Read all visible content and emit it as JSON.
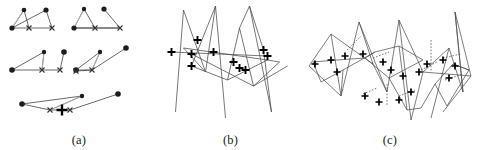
{
  "figure": {
    "background_color": "#ffffff",
    "line_color": "#3a3a3a",
    "marker_color": "#111111",
    "dot_color": "#222222",
    "faint_line_color": "#9a9a9a",
    "width": 477,
    "height": 150
  },
  "panels": [
    {
      "id": "a",
      "caption": "(a)",
      "description": "Six small point-set matching sketches: filled round dots joined to cross markers by thin straight segments",
      "marker_types": [
        "filled-dot",
        "x-cross",
        "bold-plus"
      ],
      "subfigures": [
        {
          "name": "subfigure-top-left",
          "dots": [
            [
              12,
              28
            ],
            [
              24,
              10
            ],
            [
              46,
              10
            ]
          ],
          "crosses": [
            [
              29,
              28
            ],
            [
              52,
              28
            ]
          ],
          "edges": [
            [
              0,
              1
            ],
            [
              0,
              3
            ],
            [
              1,
              3
            ],
            [
              2,
              4
            ],
            [
              3,
              4
            ],
            [
              0,
              2
            ]
          ]
        },
        {
          "name": "subfigure-top-right",
          "dots": [
            [
              74,
              28
            ],
            [
              84,
              9
            ],
            [
              104,
              9
            ]
          ],
          "crosses": [
            [
              95,
              28
            ],
            [
              120,
              28
            ]
          ],
          "edges": [
            [
              0,
              1
            ],
            [
              0,
              3
            ],
            [
              1,
              3
            ],
            [
              2,
              4
            ],
            [
              3,
              4
            ],
            [
              0,
              4
            ]
          ]
        },
        {
          "name": "subfigure-middle-left",
          "dots": [
            [
              12,
              70
            ],
            [
              44,
              52
            ],
            [
              64,
              52
            ]
          ],
          "crosses": [
            [
              42,
              70
            ],
            [
              60,
              70
            ]
          ],
          "edges": [
            [
              0,
              1
            ],
            [
              0,
              3
            ],
            [
              1,
              3
            ],
            [
              2,
              4
            ],
            [
              3,
              4
            ],
            [
              0,
              2
            ]
          ]
        },
        {
          "name": "subfigure-middle-right",
          "dots": [
            [
              76,
              70
            ],
            [
              100,
              52
            ],
            [
              126,
              48
            ]
          ],
          "crosses": [
            [
              76,
              71
            ],
            [
              92,
              70
            ]
          ],
          "edges": [
            [
              0,
              1
            ],
            [
              0,
              4
            ],
            [
              1,
              4
            ],
            [
              2,
              4
            ],
            [
              3,
              4
            ],
            [
              0,
              2
            ]
          ]
        },
        {
          "name": "subfigure-bottom",
          "dots": [
            [
              22,
              104
            ],
            [
              82,
              96
            ],
            [
              118,
              94
            ]
          ],
          "crosses": [
            [
              50,
              110
            ],
            [
              70,
              110
            ]
          ],
          "plus": [
            [
              62,
              110
            ]
          ],
          "edges": [
            [
              0,
              1
            ],
            [
              0,
              3
            ],
            [
              1,
              3
            ],
            [
              2,
              4
            ],
            [
              3,
              4
            ],
            [
              0,
              4
            ]
          ]
        }
      ]
    },
    {
      "id": "b",
      "caption": "(b)",
      "description": "Single zigzag polyline graph with long crossing edges and bold plus markers at correspondence points",
      "marker_types": [
        "bold-plus"
      ],
      "polyline": [
        [
          14,
          112
        ],
        [
          22,
          10
        ],
        [
          44,
          72
        ],
        [
          54,
          6
        ],
        [
          64,
          118
        ],
        [
          22,
          48
        ],
        [
          106,
          60
        ],
        [
          66,
          80
        ],
        [
          78,
          28
        ],
        [
          92,
          86
        ],
        [
          118,
          62
        ],
        [
          88,
          6
        ],
        [
          110,
          112
        ],
        [
          126,
          66
        ]
      ],
      "plus_markers": [
        [
          10,
          52
        ],
        [
          36,
          40
        ],
        [
          30,
          54
        ],
        [
          30,
          66
        ],
        [
          52,
          52
        ],
        [
          72,
          62
        ],
        [
          78,
          68
        ],
        [
          84,
          70
        ],
        [
          102,
          50
        ],
        [
          106,
          56
        ]
      ]
    },
    {
      "id": "c",
      "caption": "(c)",
      "description": "Dense two-graph matching: two overlaid zigzag polylines joined by short dotted correspondence links with plus markers",
      "marker_types": [
        "bold-plus",
        "dotted-link"
      ],
      "polyline_one": [
        [
          6,
          66
        ],
        [
          28,
          34
        ],
        [
          38,
          96
        ],
        [
          56,
          22
        ],
        [
          70,
          64
        ],
        [
          84,
          92
        ],
        [
          96,
          20
        ],
        [
          108,
          120
        ],
        [
          120,
          72
        ],
        [
          146,
          48
        ],
        [
          128,
          118
        ],
        [
          160,
          92
        ],
        [
          152,
          12
        ],
        [
          168,
          76
        ],
        [
          140,
          112
        ]
      ],
      "polyline_two": [
        [
          10,
          62
        ],
        [
          34,
          60
        ],
        [
          62,
          58
        ],
        [
          86,
          78
        ],
        [
          104,
          110
        ],
        [
          118,
          108
        ],
        [
          132,
          84
        ],
        [
          150,
          64
        ],
        [
          166,
          70
        ],
        [
          144,
          106
        ],
        [
          120,
          60
        ],
        [
          96,
          46
        ],
        [
          72,
          52
        ],
        [
          40,
          70
        ],
        [
          18,
          82
        ]
      ],
      "plus_markers": [
        [
          12,
          64
        ],
        [
          28,
          60
        ],
        [
          42,
          56
        ],
        [
          60,
          54
        ],
        [
          80,
          62
        ],
        [
          88,
          70
        ],
        [
          100,
          76
        ],
        [
          116,
          72
        ],
        [
          124,
          64
        ],
        [
          140,
          60
        ],
        [
          152,
          66
        ],
        [
          146,
          78
        ],
        [
          108,
          92
        ],
        [
          96,
          100
        ],
        [
          62,
          96
        ],
        [
          76,
          102
        ],
        [
          34,
          72
        ]
      ],
      "dotted_links": [
        [
          [
            44,
            50
          ],
          [
            58,
            36
          ]
        ],
        [
          [
            70,
            58
          ],
          [
            86,
            52
          ]
        ],
        [
          [
            96,
            96
          ],
          [
            112,
            90
          ]
        ],
        [
          [
            118,
            70
          ],
          [
            134,
            62
          ]
        ],
        [
          [
            140,
            58
          ],
          [
            158,
            54
          ]
        ],
        [
          [
            60,
            94
          ],
          [
            74,
            88
          ]
        ],
        [
          [
            142,
            80
          ],
          [
            160,
            74
          ]
        ]
      ]
    }
  ]
}
